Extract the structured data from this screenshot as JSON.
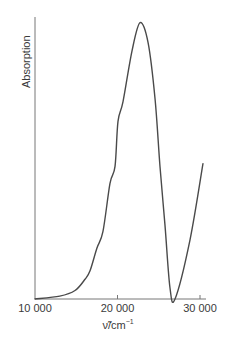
{
  "chart_data": {
    "type": "line",
    "title": "",
    "xlabel": "ν̃/cm⁻¹",
    "xlabel_main": "ν̃/cm",
    "xlabel_sup": "−1",
    "ylabel": "Absorption",
    "xlim": [
      10000,
      30500
    ],
    "ylim": [
      0,
      1
    ],
    "x_ticks": [
      10000,
      20000,
      30000
    ],
    "x_tick_labels": [
      "10 000",
      "20 000",
      "30 000"
    ],
    "y_ticks": [],
    "grid": false,
    "legend": null,
    "colors": {
      "line": "#4a4a4a",
      "axis": "#777777"
    },
    "series": [
      {
        "name": "Absorption",
        "x": [
          10000,
          13000,
          14850,
          16060,
          16670,
          17500,
          18240,
          19090,
          19700,
          20060,
          20670,
          21760,
          22730,
          23700,
          24550,
          25150,
          25760,
          26360,
          26970,
          28790,
          30360
        ],
        "y": [
          0.0,
          0.01,
          0.03,
          0.07,
          0.1,
          0.18,
          0.24,
          0.41,
          0.47,
          0.63,
          0.7,
          0.88,
          0.98,
          0.91,
          0.71,
          0.47,
          0.26,
          0.04,
          0.0,
          0.21,
          0.48
        ]
      }
    ]
  }
}
